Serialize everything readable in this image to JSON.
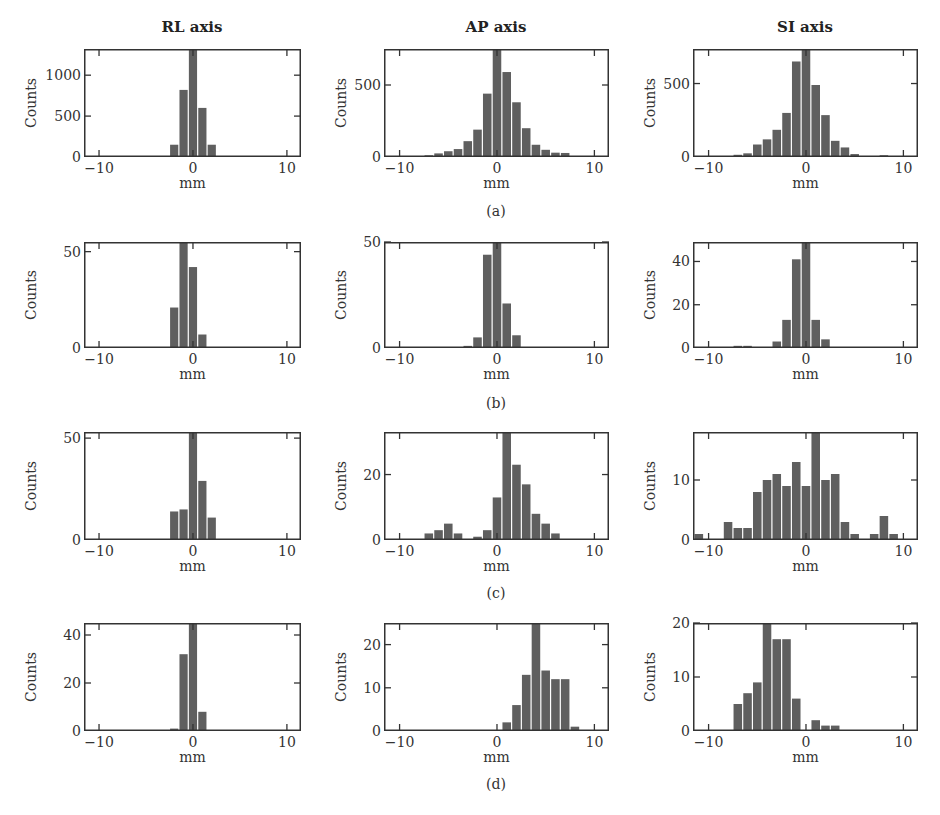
{
  "column_titles": [
    "RL axis",
    "AP axis",
    "SI axis"
  ],
  "row_labels": [
    "(a)",
    "(b)",
    "(c)",
    "(d)"
  ],
  "colors": {
    "bar": "#5f5f5f",
    "bar_edge": "#ffffff",
    "frame": "#333333",
    "text": "#333333"
  },
  "chart_data": [
    {
      "type": "bar",
      "panel": "a",
      "title": "RL axis",
      "xlabel": "mm",
      "ylabel": "Counts",
      "xlim": [
        -11.6,
        11.5
      ],
      "ylim": [
        0,
        1320
      ],
      "xticks": [
        -10,
        0,
        10
      ],
      "yticks": [
        0,
        500,
        1000
      ],
      "x": [
        -2,
        -1,
        0,
        1,
        2,
        3
      ],
      "values": [
        150,
        820,
        1320,
        600,
        150,
        5
      ]
    },
    {
      "type": "bar",
      "panel": "a",
      "title": "AP axis",
      "xlabel": "mm",
      "ylabel": "Counts",
      "xlim": [
        -11.6,
        11.5
      ],
      "ylim": [
        0,
        750
      ],
      "xticks": [
        -10,
        0,
        10
      ],
      "yticks": [
        0,
        500
      ],
      "x": [
        -9,
        -8,
        -7,
        -6,
        -5,
        -4,
        -3,
        -2,
        -1,
        0,
        1,
        2,
        3,
        4,
        5,
        6,
        7
      ],
      "values": [
        2,
        5,
        12,
        25,
        40,
        55,
        110,
        190,
        440,
        750,
        590,
        380,
        200,
        85,
        50,
        30,
        28
      ]
    },
    {
      "type": "bar",
      "panel": "a",
      "title": "SI axis",
      "xlabel": "mm",
      "ylabel": "Counts",
      "xlim": [
        -11.6,
        11.5
      ],
      "ylim": [
        0,
        735
      ],
      "xticks": [
        -10,
        0,
        10
      ],
      "yticks": [
        0,
        500
      ],
      "x": [
        -8,
        -7,
        -6,
        -5,
        -4,
        -3,
        -2,
        -1,
        0,
        1,
        2,
        3,
        4,
        5,
        6,
        7,
        8,
        9
      ],
      "values": [
        5,
        15,
        25,
        85,
        120,
        185,
        300,
        650,
        735,
        490,
        285,
        110,
        65,
        20,
        5,
        5,
        12,
        5
      ]
    },
    {
      "type": "bar",
      "panel": "b",
      "title": "RL axis",
      "xlabel": "mm",
      "ylabel": "Counts",
      "xlim": [
        -11.6,
        11.5
      ],
      "ylim": [
        0,
        55
      ],
      "xticks": [
        -10,
        0,
        10
      ],
      "yticks": [
        0,
        50
      ],
      "x": [
        -2,
        -1,
        0,
        1
      ],
      "values": [
        21,
        55,
        42,
        7
      ]
    },
    {
      "type": "bar",
      "panel": "b",
      "title": "AP axis",
      "xlabel": "mm",
      "ylabel": "Counts",
      "xlim": [
        -11.6,
        11.5
      ],
      "ylim": [
        0,
        50
      ],
      "xticks": [
        -10,
        0,
        10
      ],
      "yticks": [
        0,
        50
      ],
      "x": [
        -3,
        -2,
        -1,
        0,
        1,
        2
      ],
      "values": [
        1,
        5,
        44,
        50,
        21,
        6
      ]
    },
    {
      "type": "bar",
      "panel": "b",
      "title": "SI axis",
      "xlabel": "mm",
      "ylabel": "Counts",
      "xlim": [
        -11.6,
        11.5
      ],
      "ylim": [
        0,
        49
      ],
      "xticks": [
        -10,
        0,
        10
      ],
      "yticks": [
        0,
        20,
        40
      ],
      "x": [
        -7,
        -6,
        -3,
        -2,
        -1,
        0,
        1,
        2
      ],
      "values": [
        1,
        1,
        3,
        13,
        41,
        49,
        13,
        4
      ]
    },
    {
      "type": "bar",
      "panel": "c",
      "title": "RL axis",
      "xlabel": "mm",
      "ylabel": "Counts",
      "xlim": [
        -11.6,
        11.5
      ],
      "ylim": [
        0,
        53
      ],
      "xticks": [
        -10,
        0,
        10
      ],
      "yticks": [
        0,
        50
      ],
      "x": [
        -2,
        -1,
        0,
        1,
        2
      ],
      "values": [
        14,
        15,
        53,
        29,
        11
      ]
    },
    {
      "type": "bar",
      "panel": "c",
      "title": "AP axis",
      "xlabel": "mm",
      "ylabel": "Counts",
      "xlim": [
        -11.6,
        11.5
      ],
      "ylim": [
        0,
        33
      ],
      "xticks": [
        -10,
        0,
        10
      ],
      "yticks": [
        0,
        20
      ],
      "x": [
        -7,
        -6,
        -5,
        -4,
        -2,
        -1,
        0,
        1,
        2,
        3,
        4,
        5,
        6
      ],
      "values": [
        2,
        3,
        5,
        2,
        1,
        3,
        13,
        33,
        23,
        17,
        8,
        5,
        2
      ]
    },
    {
      "type": "bar",
      "panel": "c",
      "title": "SI axis",
      "xlabel": "mm",
      "ylabel": "Counts",
      "xlim": [
        -11.6,
        11.5
      ],
      "ylim": [
        0,
        18
      ],
      "xticks": [
        -10,
        0,
        10
      ],
      "yticks": [
        0,
        10
      ],
      "x": [
        -11,
        -8,
        -7,
        -6,
        -5,
        -4,
        -3,
        -2,
        -1,
        0,
        1,
        2,
        3,
        4,
        5,
        7,
        8,
        9
      ],
      "values": [
        1,
        3,
        2,
        2,
        8,
        10,
        11,
        9,
        13,
        9,
        18,
        10,
        11,
        3,
        1,
        1,
        4,
        1
      ]
    },
    {
      "type": "bar",
      "panel": "d",
      "title": "RL axis",
      "xlabel": "mm",
      "ylabel": "Counts",
      "xlim": [
        -11.6,
        11.5
      ],
      "ylim": [
        0,
        45
      ],
      "xticks": [
        -10,
        0,
        10
      ],
      "yticks": [
        0,
        20,
        40
      ],
      "x": [
        -2,
        -1,
        0,
        1
      ],
      "values": [
        1,
        32,
        45,
        8
      ]
    },
    {
      "type": "bar",
      "panel": "d",
      "title": "AP axis",
      "xlabel": "mm",
      "ylabel": "Counts",
      "xlim": [
        -11.6,
        11.5
      ],
      "ylim": [
        0,
        25
      ],
      "xticks": [
        -10,
        0,
        10
      ],
      "yticks": [
        0,
        10,
        20
      ],
      "x": [
        1,
        2,
        3,
        4,
        5,
        6,
        7,
        8
      ],
      "values": [
        2,
        6,
        13,
        25,
        14,
        12,
        12,
        1
      ]
    },
    {
      "type": "bar",
      "panel": "d",
      "title": "SI axis",
      "xlabel": "mm",
      "ylabel": "Counts",
      "xlim": [
        -11.6,
        11.5
      ],
      "ylim": [
        0,
        20
      ],
      "xticks": [
        -10,
        0,
        10
      ],
      "yticks": [
        0,
        10,
        20
      ],
      "x": [
        -7,
        -6,
        -5,
        -4,
        -3,
        -2,
        -1,
        1,
        2,
        3
      ],
      "values": [
        5,
        7,
        9,
        20,
        17,
        17,
        6,
        2,
        1,
        1
      ]
    }
  ]
}
